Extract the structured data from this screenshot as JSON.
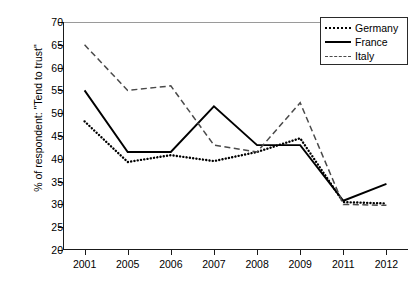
{
  "chart_data": {
    "type": "line",
    "title": "",
    "xlabel": "",
    "ylabel": "% of respondent: \"Tend to trust\"",
    "categories": [
      "2001",
      "2005",
      "2006",
      "2007",
      "2008",
      "2009",
      "2011",
      "2012"
    ],
    "ylim": [
      20,
      70
    ],
    "yticks": [
      20,
      25,
      30,
      35,
      40,
      45,
      50,
      55,
      60,
      65,
      70
    ],
    "grid": false,
    "legend_position": "top-right",
    "series": [
      {
        "name": "Germany",
        "style": "dotted",
        "color": "#000000",
        "values": [
          48.2,
          39.3,
          40.8,
          39.5,
          41.5,
          44.5,
          30.5,
          30.2
        ]
      },
      {
        "name": "France",
        "style": "solid",
        "color": "#000000",
        "values": [
          55.0,
          41.5,
          41.5,
          51.5,
          43.0,
          43.0,
          30.8,
          34.5
        ]
      },
      {
        "name": "Italy",
        "style": "dashed",
        "color": "#4a4a4a",
        "values": [
          65.0,
          55.0,
          56.0,
          43.0,
          41.5,
          52.3,
          30.0,
          29.8
        ]
      }
    ]
  },
  "legend": {
    "items": [
      {
        "label": "Germany",
        "key": "dotted-line-key"
      },
      {
        "label": "France",
        "key": "solid-line-key"
      },
      {
        "label": "Italy",
        "key": "dashed-line-key"
      }
    ]
  }
}
